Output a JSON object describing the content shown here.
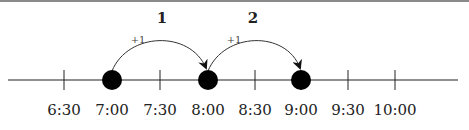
{
  "diagram": {
    "type": "number-line",
    "ticks": [
      {
        "label": "6:30",
        "x": 64,
        "dot": false
      },
      {
        "label": "7:00",
        "x": 112,
        "dot": true
      },
      {
        "label": "7:30",
        "x": 160,
        "dot": false
      },
      {
        "label": "8:00",
        "x": 208,
        "dot": true
      },
      {
        "label": "8:30",
        "x": 255,
        "dot": false
      },
      {
        "label": "9:00",
        "x": 301,
        "dot": true
      },
      {
        "label": "9:30",
        "x": 348,
        "dot": false
      },
      {
        "label": "10:00",
        "x": 395,
        "dot": false
      }
    ],
    "jumps": [
      {
        "step": "1",
        "increment": "+1",
        "from": "7:00",
        "to": "8:00"
      },
      {
        "step": "2",
        "increment": "+1",
        "from": "8:00",
        "to": "9:00"
      }
    ],
    "colors": {
      "line": "#222222",
      "dot": "#000000",
      "border": "#8a8a8a"
    }
  }
}
